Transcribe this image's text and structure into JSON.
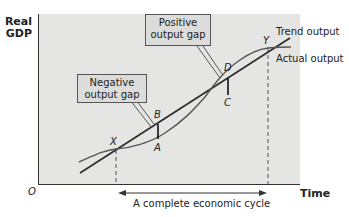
{
  "axes": {
    "y_label_line1": "Real",
    "y_label_line2": "GDP",
    "x_label": "Time",
    "origin": "O"
  },
  "callouts": {
    "negative": {
      "line1": "Negative",
      "line2": "output gap"
    },
    "positive": {
      "line1": "Positive",
      "line2": "output gap"
    }
  },
  "points": {
    "X": "X",
    "A": "A",
    "B": "B",
    "C": "C",
    "D": "D",
    "Y": "Y"
  },
  "series": {
    "trend": "Trend output",
    "actual": "Actual output"
  },
  "annotation": {
    "cycle": "A complete economic cycle"
  },
  "colors": {
    "plot_background": "#e5e5e4",
    "line": "#2a2a2a",
    "callout_fill": "#dcdcdb"
  }
}
